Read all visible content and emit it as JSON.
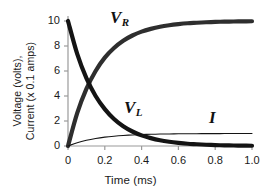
{
  "chart_data": {
    "type": "line",
    "title": "",
    "xlabel": "Time (ms)",
    "ylabel": "Voltage (volts), Current (x 0.1 amps)",
    "ylabel_line1": "Voltage (volts),",
    "ylabel_line2": "Current (x 0.1 amps)",
    "xlim": [
      0,
      1.0
    ],
    "ylim": [
      0,
      10.4
    ],
    "grid": false,
    "legend": "inline-curve-labels",
    "xticks": [
      "0",
      "0.2",
      "0.4",
      "0.6",
      "0.8",
      "1.0"
    ],
    "xtick_values": [
      0,
      0.2,
      0.4,
      0.6,
      0.8,
      1.0
    ],
    "yticks": [
      "0",
      "2",
      "4",
      "6",
      "8",
      "10"
    ],
    "ytick_values": [
      0,
      2,
      4,
      6,
      8,
      10
    ],
    "x": [
      0,
      0.05,
      0.1,
      0.15,
      0.2,
      0.25,
      0.3,
      0.35,
      0.4,
      0.45,
      0.5,
      0.55,
      0.6,
      0.65,
      0.7,
      0.75,
      0.8,
      0.85,
      0.9,
      0.95,
      1.0
    ],
    "series": [
      {
        "name": "V_R",
        "label": "V",
        "sublabel": "R",
        "color": "#2e2e2e",
        "width": "thick",
        "description": "Resistor voltage rising exponentially toward 10 volts",
        "values": [
          0,
          2.63,
          4.57,
          6.0,
          7.07,
          7.84,
          8.42,
          8.84,
          9.15,
          9.37,
          9.54,
          9.66,
          9.75,
          9.82,
          9.86,
          9.9,
          9.93,
          9.95,
          9.96,
          9.97,
          9.98
        ]
      },
      {
        "name": "V_L",
        "label": "V",
        "sublabel": "L",
        "color": "#141414",
        "width": "thick",
        "description": "Inductor voltage decaying exponentially from 10 volts to 0",
        "values": [
          10,
          7.37,
          5.43,
          4.0,
          2.95,
          2.16,
          1.58,
          1.16,
          0.85,
          0.63,
          0.46,
          0.34,
          0.25,
          0.18,
          0.14,
          0.1,
          0.07,
          0.05,
          0.04,
          0.03,
          0.02
        ]
      },
      {
        "name": "I",
        "label": "I",
        "sublabel": "",
        "color": "#141414",
        "width": "thin",
        "description": "Current rising exponentially toward 0.1 amps (plotted x 0.1 amps = 1.0)",
        "values": [
          0,
          0.263,
          0.457,
          0.6,
          0.707,
          0.784,
          0.842,
          0.884,
          0.915,
          0.937,
          0.954,
          0.966,
          0.975,
          0.982,
          0.986,
          0.99,
          0.993,
          0.995,
          0.996,
          0.997,
          0.998
        ]
      }
    ],
    "annotations": [
      {
        "text": "V",
        "sub": "R",
        "x": 0.27,
        "y": 10.2
      },
      {
        "text": "V",
        "sub": "L",
        "x": 0.42,
        "y": 3.2
      },
      {
        "text": "I",
        "sub": "",
        "x": 0.86,
        "y": 2.4
      }
    ]
  },
  "axes": {
    "axis_color": "#9a9a9a",
    "tick_color": "#9a9a9a"
  }
}
